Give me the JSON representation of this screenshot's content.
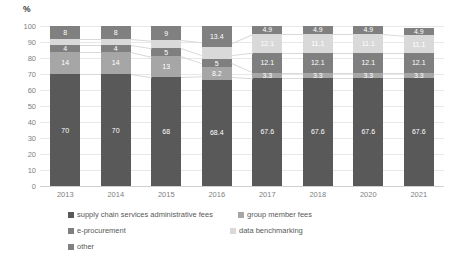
{
  "chart_data": {
    "type": "bar",
    "title": "",
    "xlabel": "",
    "ylabel": "%",
    "ylim": [
      0,
      100
    ],
    "yticks": [
      0,
      10,
      20,
      30,
      40,
      50,
      60,
      70,
      80,
      90,
      100
    ],
    "grid": true,
    "stacked": true,
    "legend_position": "bottom",
    "categories": [
      "2013",
      "2014",
      "2015",
      "2016",
      "2017",
      "2018",
      "2020",
      "2021"
    ],
    "series": [
      {
        "name": "supply chain services administrative fees",
        "color": "#595959",
        "values": [
          70,
          70,
          68,
          68.4,
          67.6,
          67.6,
          67.6,
          67.6
        ],
        "labels": [
          "70",
          "70",
          "68",
          "68.4",
          "67.6",
          "67.6",
          "67.6",
          "67.6"
        ]
      },
      {
        "name": "group member fees",
        "color": "#a6a6a6",
        "values": [
          14,
          14,
          13,
          8.2,
          3.3,
          3.3,
          3.3,
          3.3
        ],
        "labels": [
          "14",
          "14",
          "13",
          "8.2",
          "3.3",
          "3.3",
          "3.3",
          "3.3"
        ]
      },
      {
        "name": "e-procurement",
        "color": "#7f7f7f",
        "values": [
          4,
          4,
          5,
          5,
          12.1,
          12.1,
          12.1,
          12.1
        ],
        "labels": [
          "4",
          "4",
          "5",
          "5",
          "12.1",
          "12.1",
          "12.1",
          "12.1"
        ]
      },
      {
        "name": "data benchmarking",
        "color": "#d9d9d9",
        "values": [
          4,
          4,
          5,
          8,
          12.1,
          12.1,
          12.1,
          11.1
        ],
        "labels": [
          "",
          "",
          "",
          "",
          "12.1",
          "11.1",
          "11.1",
          "11.1"
        ]
      },
      {
        "name": "other",
        "color": "#808080",
        "values": [
          8,
          8,
          9,
          13.4,
          4.9,
          4.9,
          4.9,
          4.9
        ],
        "labels": [
          "8",
          "8",
          "9",
          "13.4",
          "4.9",
          "4.9",
          "4.9",
          "4.9"
        ]
      }
    ]
  },
  "legend": {
    "items": [
      {
        "label": "supply chain services administrative fees",
        "color": "#595959"
      },
      {
        "label": "group member fees",
        "color": "#a6a6a6"
      },
      {
        "label": "e-procurement",
        "color": "#7f7f7f"
      },
      {
        "label": "data benchmarking",
        "color": "#d9d9d9"
      },
      {
        "label": "other",
        "color": "#808080"
      }
    ]
  }
}
